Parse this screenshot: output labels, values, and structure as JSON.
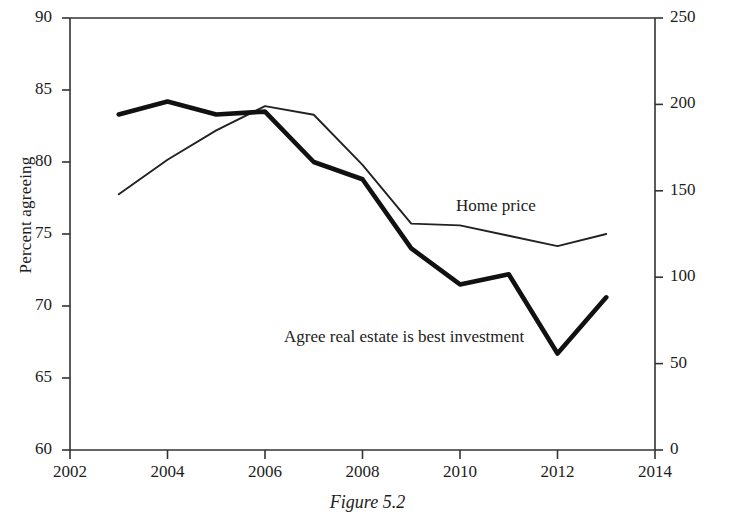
{
  "figure": {
    "caption": "Figure 5.2"
  },
  "labels": {
    "home_price": "Home price",
    "agree": "Agree real estate is best investment"
  },
  "chart_data": {
    "type": "line",
    "title": "",
    "xlabel": "",
    "ylabel": "Percent agreeing",
    "y2label": "Real S&P Case-Shiller Home Price Index",
    "xlim": [
      2002,
      2014
    ],
    "ylim": [
      60,
      90
    ],
    "y2lim": [
      0,
      250
    ],
    "xticks": [
      2002,
      2004,
      2006,
      2008,
      2010,
      2012,
      2014
    ],
    "yticks": [
      60,
      65,
      70,
      75,
      80,
      85,
      90
    ],
    "y2ticks": [
      0,
      50,
      100,
      150,
      200,
      250
    ],
    "grid": false,
    "legend": "in-plot annotations",
    "x": [
      2003,
      2004,
      2005,
      2006,
      2007,
      2008,
      2009,
      2010,
      2011,
      2012,
      2013
    ],
    "series": [
      {
        "name": "Agree real estate is best investment",
        "axis": "left",
        "units": "Percent agreeing",
        "style": "thick-black-line",
        "values": [
          83.3,
          84.2,
          83.3,
          83.5,
          80.0,
          78.8,
          74.0,
          71.5,
          72.2,
          66.7,
          70.6
        ]
      },
      {
        "name": "Home price",
        "axis": "right",
        "units": "Real S&P Case-Shiller Home Price Index",
        "style": "thin-black-line",
        "values": [
          148,
          168,
          185,
          199,
          194,
          165,
          131,
          130,
          124,
          118,
          125
        ]
      }
    ],
    "colors": {
      "line_agree": "#111111",
      "line_home_price": "#222222",
      "axis": "#333333",
      "background": "#ffffff"
    }
  },
  "ticks": {
    "left": [
      "90",
      "85",
      "80",
      "75",
      "70",
      "65",
      "60"
    ],
    "right": [
      "250",
      "200",
      "150",
      "100",
      "50",
      "0"
    ],
    "bottom": [
      "2002",
      "2004",
      "2006",
      "2008",
      "2010",
      "2012",
      "2014"
    ]
  }
}
